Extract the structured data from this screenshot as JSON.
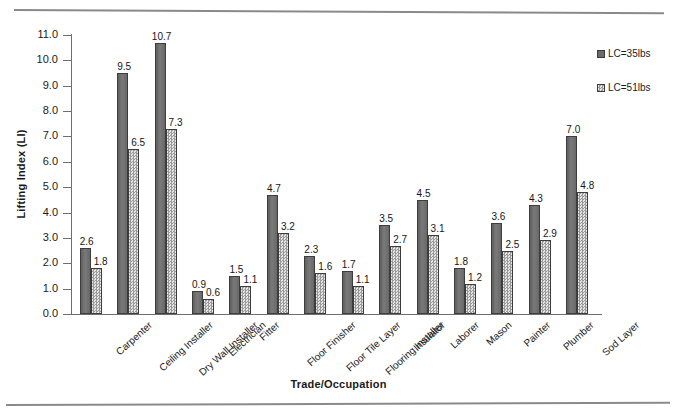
{
  "chart_data": {
    "type": "bar",
    "title": "",
    "xlabel": "Trade/Occupation",
    "ylabel": "Lifting Index  (LI)",
    "ylim": [
      0.0,
      11.0
    ],
    "ytick_step": 1.0,
    "ytick_labels": [
      "0.0",
      "1.0",
      "2.0",
      "3.0",
      "4.0",
      "5.0",
      "6.0",
      "7.0",
      "8.0",
      "9.0",
      "10.0",
      "11.0"
    ],
    "grid": false,
    "legend_position": "right",
    "categories": [
      "Carpenter",
      "Ceiling Installer",
      "Dry Wall Installer",
      "Electrician",
      "Fitter",
      "Floor Finisher",
      "Floor Tile Layer",
      "Flooring Installer",
      "Insulator",
      "Laborer",
      "Mason",
      "Painter",
      "Plumber",
      "Sod Layer"
    ],
    "series": [
      {
        "name": "LC=35lbs",
        "color": "#6b6b6b",
        "values": [
          2.6,
          9.5,
          10.7,
          0.9,
          1.5,
          4.7,
          2.3,
          1.7,
          3.5,
          4.5,
          1.8,
          3.6,
          4.3,
          7.0
        ],
        "labels": [
          "2.6",
          "9.5",
          "10.7",
          "0.9",
          "1.5",
          "4.7",
          "2.3",
          "1.7",
          "3.5",
          "4.5",
          "1.8",
          "3.6",
          "4.3",
          "7.0"
        ]
      },
      {
        "name": "LC=51lbs",
        "color": "#cfcfcf",
        "values": [
          1.8,
          6.5,
          7.3,
          0.6,
          1.1,
          3.2,
          1.6,
          1.1,
          2.7,
          3.1,
          1.2,
          2.5,
          2.9,
          4.8
        ],
        "labels": [
          "1.8",
          "6.5",
          "7.3",
          "0.6",
          "1.1",
          "3.2",
          "1.6",
          "1.1",
          "2.7",
          "3.1",
          "1.2",
          "2.5",
          "2.9",
          "4.8"
        ]
      }
    ]
  },
  "legend": {
    "items": [
      {
        "label": "LC=35lbs",
        "style": "dark"
      },
      {
        "label": "LC=51lbs",
        "style": "light"
      }
    ]
  }
}
